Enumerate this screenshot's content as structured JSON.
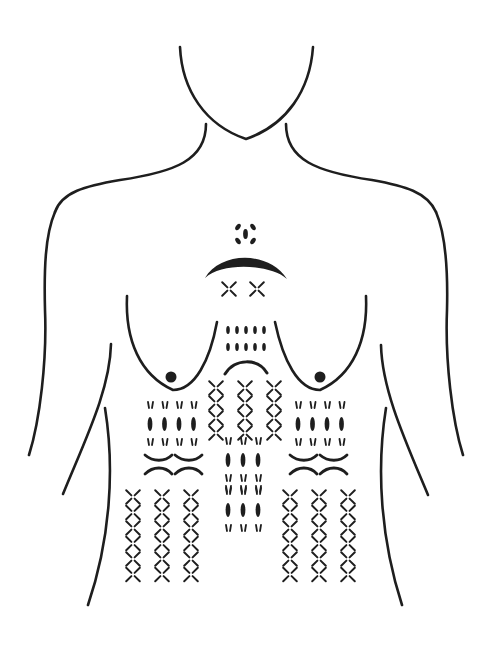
{
  "diagram": {
    "stroke_color": "#1e1e1e",
    "background_color": "#ffffff",
    "regions": [
      {
        "id": "throat-mark",
        "pattern": "four-oval-ring",
        "center": [
          243,
          236
        ]
      },
      {
        "id": "clavicle-arc",
        "pattern": "thick-crescent",
        "center": [
          243,
          268
        ]
      },
      {
        "id": "upper-sternum",
        "pattern": "x-cross",
        "cols": 2,
        "rows": 1,
        "origin": [
          229,
          289
        ]
      },
      {
        "id": "mid-sternum",
        "pattern": "vertical-dashes",
        "cols": 5,
        "rows": 2,
        "origin": [
          228,
          330
        ]
      },
      {
        "id": "xiphoid-arc",
        "pattern": "thin-arc",
        "center": [
          245,
          368
        ]
      },
      {
        "id": "epigastric",
        "pattern": "x-cross",
        "cols": 3,
        "rows": 2,
        "origin": [
          216,
          388
        ]
      },
      {
        "id": "left-hypochondriac",
        "pattern": "ovals-with-ticks",
        "cols": 4,
        "origin": [
          152,
          412
        ]
      },
      {
        "id": "right-hypochondriac",
        "pattern": "ovals-with-ticks",
        "cols": 4,
        "origin": [
          300,
          412
        ]
      },
      {
        "id": "left-flank-arcs",
        "pattern": "paired-arcs",
        "cols": 2,
        "origin": [
          160,
          462
        ]
      },
      {
        "id": "right-flank-arcs",
        "pattern": "paired-arcs",
        "cols": 2,
        "origin": [
          305,
          462
        ]
      },
      {
        "id": "midline-abdomen",
        "pattern": "ovals-with-ticks",
        "cols": 3,
        "blocks": 2,
        "origin": [
          230,
          448
        ]
      },
      {
        "id": "left-lower-abdomen",
        "pattern": "x-cross",
        "cols": 3,
        "rows": 3,
        "origin": [
          133,
          497
        ]
      },
      {
        "id": "right-lower-abdomen",
        "pattern": "x-cross",
        "cols": 3,
        "rows": 3,
        "origin": [
          290,
          497
        ]
      },
      {
        "id": "left-nipple",
        "pattern": "dot",
        "center": [
          171,
          377
        ]
      },
      {
        "id": "right-nipple",
        "pattern": "dot",
        "center": [
          320,
          377
        ]
      }
    ]
  }
}
